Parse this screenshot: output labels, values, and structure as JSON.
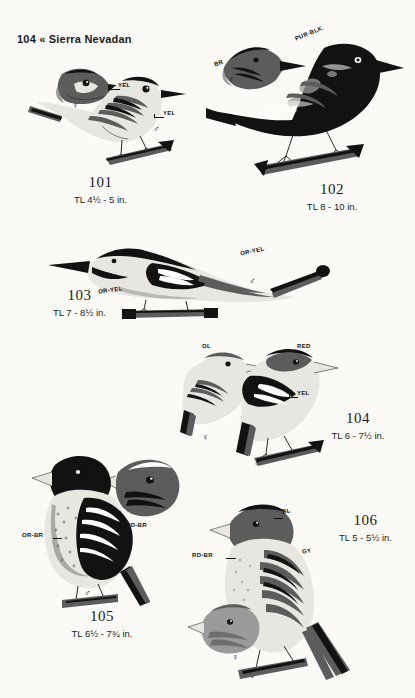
{
  "page": {
    "header": "104 « Sierra Nevadan",
    "page_number": "104",
    "region": "Sierra Nevadan",
    "background_color": "#fbfaf7",
    "ink_color": "#121212"
  },
  "plates": [
    {
      "id": "plate-101",
      "number": "101",
      "size_label": "TL 4½ - 5 in.",
      "figures": [
        {
          "sex": "♀",
          "role": "female-head"
        },
        {
          "sex": "♂",
          "role": "male-full"
        }
      ],
      "color_marks": [
        {
          "text": "YEL",
          "target": "female-throat"
        },
        {
          "text": "YEL",
          "target": "male-breast"
        }
      ]
    },
    {
      "id": "plate-102",
      "number": "102",
      "size_label": "TL 8 - 10 in.",
      "figures": [
        {
          "sex": "♀",
          "role": "female-head"
        },
        {
          "sex": "♂",
          "role": "male-full"
        }
      ],
      "color_marks": [
        {
          "text": "BR",
          "target": "female-head"
        },
        {
          "text": "PUR-BLK.",
          "target": "male-back"
        }
      ]
    },
    {
      "id": "plate-103",
      "number": "103",
      "size_label": "TL 7 - 8½ in.",
      "figures": [
        {
          "sex": "♂",
          "role": "male-full"
        }
      ],
      "color_marks": [
        {
          "text": "OR-YEL",
          "target": "breast"
        },
        {
          "text": "OR-YEL",
          "target": "tail"
        }
      ]
    },
    {
      "id": "plate-104",
      "number": "104",
      "size_label": "TL 6 - 7½ in.",
      "figures": [
        {
          "sex": "♀",
          "role": "female-full"
        },
        {
          "sex": "♂",
          "role": "male-full"
        }
      ],
      "color_marks": [
        {
          "text": "OL",
          "target": "female-crown"
        },
        {
          "text": "YEL",
          "target": "female-breast"
        },
        {
          "text": "RED",
          "target": "male-head"
        },
        {
          "text": "YEL",
          "target": "male-breast"
        }
      ]
    },
    {
      "id": "plate-105",
      "number": "105",
      "size_label": "TL 6½ - 7¾ in.",
      "figures": [
        {
          "sex": "♂",
          "role": "male-full"
        },
        {
          "sex": "",
          "role": "head-study"
        }
      ],
      "color_marks": [
        {
          "text": "OR-BR",
          "target": "breast"
        },
        {
          "text": "RD-BR",
          "target": "head-study"
        }
      ]
    },
    {
      "id": "plate-106",
      "number": "106",
      "size_label": "TL 5 - 5½ in.",
      "figures": [
        {
          "sex": "♂",
          "role": "male-full"
        },
        {
          "sex": "♀",
          "role": "female-head"
        }
      ],
      "color_marks": [
        {
          "text": "BL",
          "target": "crown"
        },
        {
          "text": "RD-BR",
          "target": "face"
        },
        {
          "text": "GY",
          "target": "flank"
        }
      ]
    }
  ]
}
